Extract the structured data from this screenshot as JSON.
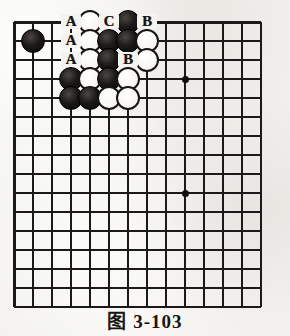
{
  "figure": {
    "caption_symbol": "图",
    "caption_number": "3-103",
    "caption_full": "图 3-103",
    "kind": "go-board-diagram"
  },
  "board": {
    "columns": 14,
    "rows": 16,
    "origin_x": 14,
    "origin_y": 22,
    "spacing": 19,
    "top_edge_is_board_boundary": true,
    "left_edge_is_board_boundary": true,
    "line_color": "#1c1a18",
    "paper_color": "#f2f1ee",
    "star_points": [
      {
        "col": 4,
        "row": 4
      },
      {
        "col": 10,
        "row": 4
      },
      {
        "col": 10,
        "row": 10
      }
    ],
    "stones": [
      {
        "color": "white",
        "col": 5,
        "row": 1
      },
      {
        "color": "black",
        "col": 7,
        "row": 1
      },
      {
        "color": "black",
        "col": 2,
        "row": 2
      },
      {
        "color": "white",
        "col": 5,
        "row": 2
      },
      {
        "color": "black",
        "col": 6,
        "row": 2
      },
      {
        "color": "black",
        "col": 7,
        "row": 2
      },
      {
        "color": "white",
        "col": 8,
        "row": 2
      },
      {
        "color": "white",
        "col": 5,
        "row": 3
      },
      {
        "color": "black",
        "col": 6,
        "row": 3
      },
      {
        "color": "white",
        "col": 8,
        "row": 3
      },
      {
        "color": "black",
        "col": 4,
        "row": 4
      },
      {
        "color": "white",
        "col": 5,
        "row": 4
      },
      {
        "color": "black",
        "col": 6,
        "row": 4
      },
      {
        "color": "white",
        "col": 7,
        "row": 4
      },
      {
        "color": "black",
        "col": 4,
        "row": 5
      },
      {
        "color": "black",
        "col": 5,
        "row": 5
      },
      {
        "color": "white",
        "col": 6,
        "row": 5
      },
      {
        "color": "white",
        "col": 7,
        "row": 5
      }
    ],
    "labels": [
      {
        "text": "A",
        "col": 4,
        "row": 1
      },
      {
        "text": "C",
        "col": 6,
        "row": 1
      },
      {
        "text": "B",
        "col": 8,
        "row": 1
      },
      {
        "text": "A",
        "col": 4,
        "row": 2
      },
      {
        "text": "A",
        "col": 4,
        "row": 3
      },
      {
        "text": "B",
        "col": 7,
        "row": 3
      }
    ]
  }
}
